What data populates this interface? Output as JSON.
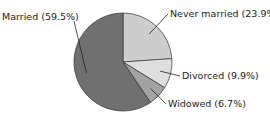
{
  "chart_data": {
    "type": "pie",
    "title": "",
    "categories": [
      "Married",
      "Never married",
      "Divorced",
      "Widowed"
    ],
    "values": [
      59.5,
      23.9,
      9.9,
      6.7
    ],
    "unit": "%",
    "colors": [
      "#707070",
      "#cdcdcd",
      "#dedede",
      "#a3a3a3"
    ],
    "labels": [
      "Married (59.5%)",
      "Never married (23.9%)",
      "Divorced (9.9%)",
      "Widowed (6.7%)"
    ],
    "start_angle_deg": 0,
    "direction": "clockwise from 12 o'clock",
    "legend": "none (direct leader-line labels)"
  }
}
